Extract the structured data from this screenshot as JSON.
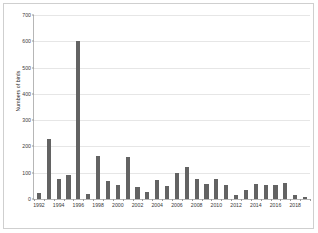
{
  "chart_data": {
    "type": "bar",
    "title": "",
    "subtitle": "",
    "xlabel": "",
    "ylabel": "Numbers of birds",
    "ylim": [
      0,
      700
    ],
    "ytick_step": 100,
    "yticks": [
      "0",
      "100",
      "200",
      "300",
      "400",
      "500",
      "600",
      "700"
    ],
    "grid": true,
    "legend": false,
    "legend_position": "none",
    "bar_color": "#636363",
    "categories": [
      "1992",
      "1993",
      "1994",
      "1995",
      "1996",
      "1997",
      "1998",
      "1999",
      "2000",
      "2001",
      "2002",
      "2003",
      "2004",
      "2005",
      "2006",
      "2007",
      "2008",
      "2009",
      "2010",
      "2011",
      "2012",
      "2013",
      "2014",
      "2015",
      "2016",
      "2017",
      "2018",
      "2019"
    ],
    "values": [
      22,
      230,
      77,
      92,
      600,
      18,
      165,
      70,
      52,
      158,
      45,
      28,
      72,
      50,
      98,
      120,
      78,
      58,
      75,
      55,
      17,
      33,
      58,
      53,
      55,
      62,
      14,
      9
    ],
    "xtick_labels": [
      "1992",
      "1994",
      "1996",
      "1998",
      "2000",
      "2002",
      "2004",
      "2006",
      "2008",
      "2010",
      "2012",
      "2014",
      "2016",
      "2018"
    ]
  }
}
